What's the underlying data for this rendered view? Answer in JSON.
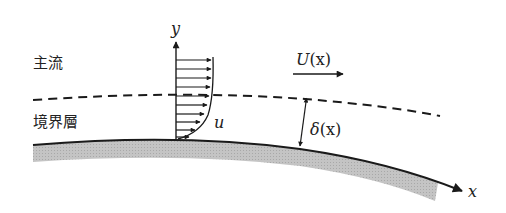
{
  "diagram": {
    "labels": {
      "main_flow": "主流",
      "boundary_layer": "境界層",
      "y_axis": "y",
      "x_axis": "x",
      "local_velocity": "u",
      "outer_velocity_sym": "U",
      "outer_velocity_arg": "(x)",
      "thickness_sym": "δ",
      "thickness_arg": "(x)"
    },
    "profile": {
      "arrow_count": 10,
      "arrow_lengths": [
        31,
        31,
        31,
        30,
        29,
        28,
        26,
        23,
        19,
        13
      ]
    },
    "colors": {
      "line": "#1a1a1a",
      "surface_fill": "#bdbdbd",
      "background": "#ffffff"
    }
  }
}
